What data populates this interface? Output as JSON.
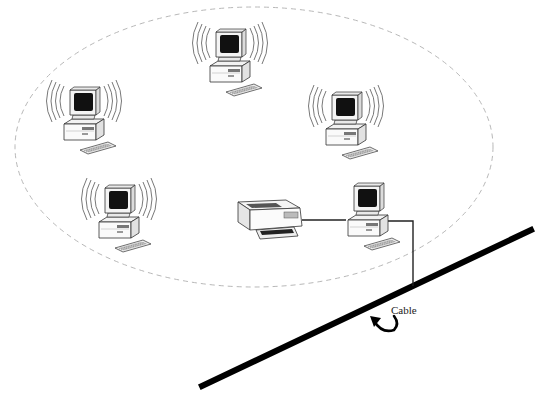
{
  "diagram": {
    "type": "wireless-lan-topology",
    "wireless_range": {
      "shape": "ellipse",
      "style": "dashed",
      "color": "#b8b8b8",
      "cx": 254,
      "cy": 147,
      "rx": 239,
      "ry": 140
    },
    "cable": {
      "label": "Cable",
      "color": "#000000",
      "from": [
        202,
        386
      ],
      "to": [
        531,
        230
      ]
    },
    "nodes": [
      {
        "id": "pc-top",
        "kind": "wireless-computer",
        "x": 232,
        "y": 58
      },
      {
        "id": "pc-left",
        "kind": "wireless-computer",
        "x": 86,
        "y": 114
      },
      {
        "id": "pc-right",
        "kind": "wireless-computer",
        "x": 344,
        "y": 120
      },
      {
        "id": "pc-bottom-left",
        "kind": "wireless-computer",
        "x": 119,
        "y": 213
      },
      {
        "id": "printer",
        "kind": "printer",
        "x": 268,
        "y": 218
      },
      {
        "id": "pc-access-point",
        "kind": "wired-computer",
        "x": 368,
        "y": 215
      }
    ],
    "links": [
      {
        "from": "printer",
        "to": "pc-access-point",
        "type": "wired"
      },
      {
        "from": "pc-access-point",
        "to": "cable",
        "type": "wired"
      }
    ]
  }
}
